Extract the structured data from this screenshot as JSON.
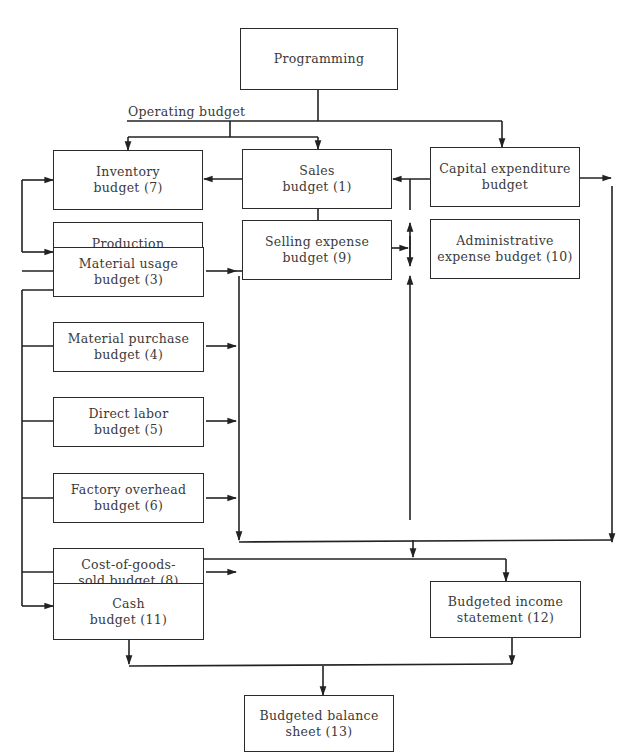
{
  "diagram": {
    "type": "budget-flowchart",
    "operating_budget_label": "Operating budget",
    "nodes": {
      "programming": {
        "line1": "Programming",
        "line2": ""
      },
      "inventory": {
        "line1": "Inventory",
        "line2": "budget (7)"
      },
      "sales": {
        "line1": "Sales",
        "line2": "budget (1)"
      },
      "capital": {
        "line1": "Capital expenditure",
        "line2": "budget"
      },
      "production": {
        "line1": "Production",
        "line2": "budget (2)"
      },
      "selling": {
        "line1": "Selling expense",
        "line2": "budget (9)"
      },
      "administrative": {
        "line1": "Administrative",
        "line2": "expense budget (10)"
      },
      "material_usage": {
        "line1": "Material usage",
        "line2": "budget (3)"
      },
      "material_purchase": {
        "line1": "Material purchase",
        "line2": "budget (4)"
      },
      "direct_labor": {
        "line1": "Direct labor",
        "line2": "budget (5)"
      },
      "factory_overhead": {
        "line1": "Factory overhead",
        "line2": "budget (6)"
      },
      "cogs": {
        "line1": "Cost-of-goods-",
        "line2": "sold budget (8)"
      },
      "cash": {
        "line1": "Cash",
        "line2": "budget (11)"
      },
      "income": {
        "line1": "Budgeted income",
        "line2": "statement (12)"
      },
      "balance": {
        "line1": "Budgeted balance",
        "line2": "sheet (13)"
      }
    },
    "edges": [
      [
        "programming",
        "operating budget"
      ],
      [
        "programming",
        "capital"
      ],
      [
        "operating budget",
        "inventory"
      ],
      [
        "operating budget",
        "sales"
      ],
      [
        "sales",
        "inventory"
      ],
      [
        "sales",
        "selling"
      ],
      [
        "capital",
        "sales"
      ],
      [
        "inventory",
        "production"
      ],
      [
        "production",
        "material_usage"
      ],
      [
        "production",
        "material_purchase"
      ],
      [
        "production",
        "direct_labor"
      ],
      [
        "production",
        "factory_overhead"
      ],
      [
        "production",
        "cogs"
      ],
      [
        "production",
        "cash"
      ],
      [
        "material_usage",
        "income/cash collector"
      ],
      [
        "material_purchase",
        "income/cash collector"
      ],
      [
        "direct_labor",
        "income/cash collector"
      ],
      [
        "factory_overhead",
        "income/cash collector"
      ],
      [
        "cogs",
        "income/cash collector"
      ],
      [
        "selling",
        "income/cash collector"
      ],
      [
        "administrative",
        "income/cash collector"
      ],
      [
        "capital",
        "income/cash collector"
      ],
      [
        "income/cash collector",
        "cash"
      ],
      [
        "income/cash collector",
        "income"
      ],
      [
        "cash",
        "balance"
      ],
      [
        "income",
        "balance"
      ]
    ]
  }
}
